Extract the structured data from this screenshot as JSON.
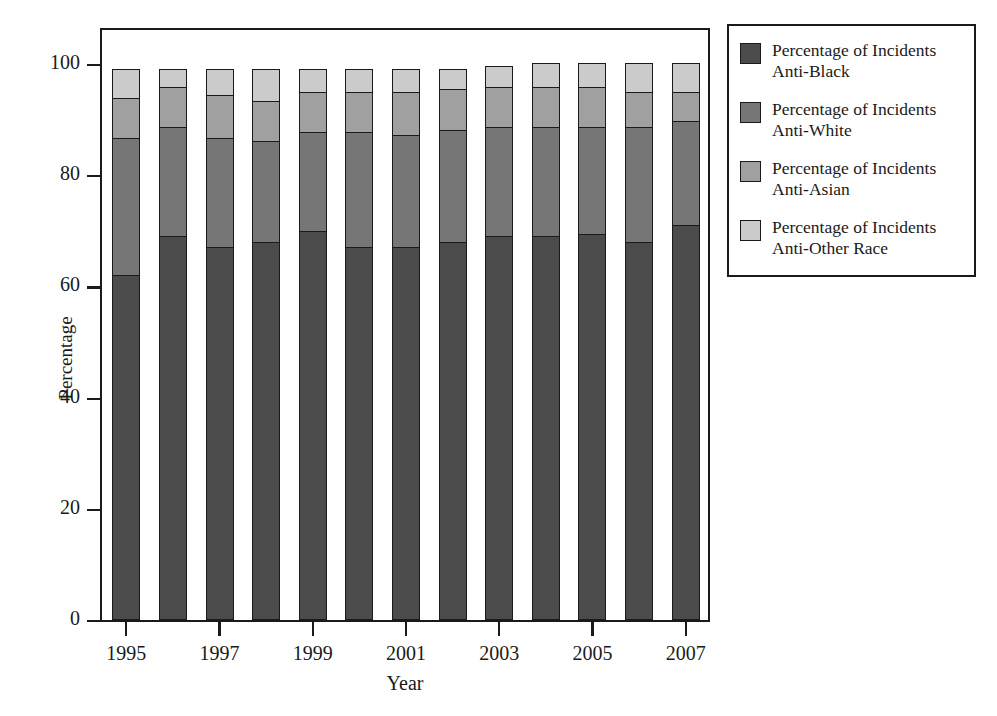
{
  "chart_data": {
    "type": "bar",
    "subtype": "stacked-bar-100",
    "title": "",
    "xlabel": "Year",
    "ylabel": "Percentage",
    "categories": [
      "1995",
      "1996",
      "1997",
      "1998",
      "1999",
      "2000",
      "2001",
      "2002",
      "2003",
      "2004",
      "2005",
      "2006",
      "2007"
    ],
    "tick_labels_x": [
      "1995",
      "1997",
      "1999",
      "2001",
      "2003",
      "2005",
      "2007"
    ],
    "tick_labels_y": [
      "0",
      "20",
      "40",
      "60",
      "80",
      "100"
    ],
    "ylim": [
      0,
      100
    ],
    "yticks": [
      0,
      20,
      40,
      60,
      80,
      100
    ],
    "grid": false,
    "legend_position": "right-outside",
    "series": [
      {
        "name": "Percentage of Incidents Anti-Black",
        "color": "#4b4b4b",
        "values": [
          62,
          69,
          67,
          68,
          70,
          67,
          67,
          68,
          69,
          69,
          69.5,
          68,
          71
        ]
      },
      {
        "name": "Percentage of Incidents Anti-White",
        "color": "#767676",
        "values": [
          25,
          20,
          20,
          18.5,
          18,
          21,
          20.5,
          20.5,
          20,
          20,
          19.5,
          21,
          19
        ]
      },
      {
        "name": "Percentage of Incidents Anti-Asian",
        "color": "#a0a0a0",
        "values": [
          7.5,
          7.5,
          8,
          7.5,
          7.5,
          7.5,
          8,
          7.5,
          7.5,
          7.5,
          7.5,
          6.5,
          5.5
        ]
      },
      {
        "name": "Percentage of Incidents Anti-Other Race",
        "color": "#cbcbcb",
        "values": [
          5.5,
          3.5,
          5,
          6,
          4.5,
          4.5,
          4.5,
          4,
          4,
          4.5,
          4.5,
          5.5,
          5.5
        ]
      }
    ]
  },
  "legend": {
    "items": [
      {
        "line1": "Percentage of Incidents",
        "line2": "Anti-Black",
        "color": "#4b4b4b"
      },
      {
        "line1": "Percentage of Incidents",
        "line2": "Anti-White",
        "color": "#767676"
      },
      {
        "line1": "Percentage of Incidents",
        "line2": "Anti-Asian",
        "color": "#a0a0a0"
      },
      {
        "line1": "Percentage of Incidents",
        "line2": "Anti-Other Race",
        "color": "#cbcbcb"
      }
    ]
  },
  "axes": {
    "x_title": "Year",
    "y_title": "Percentage"
  }
}
